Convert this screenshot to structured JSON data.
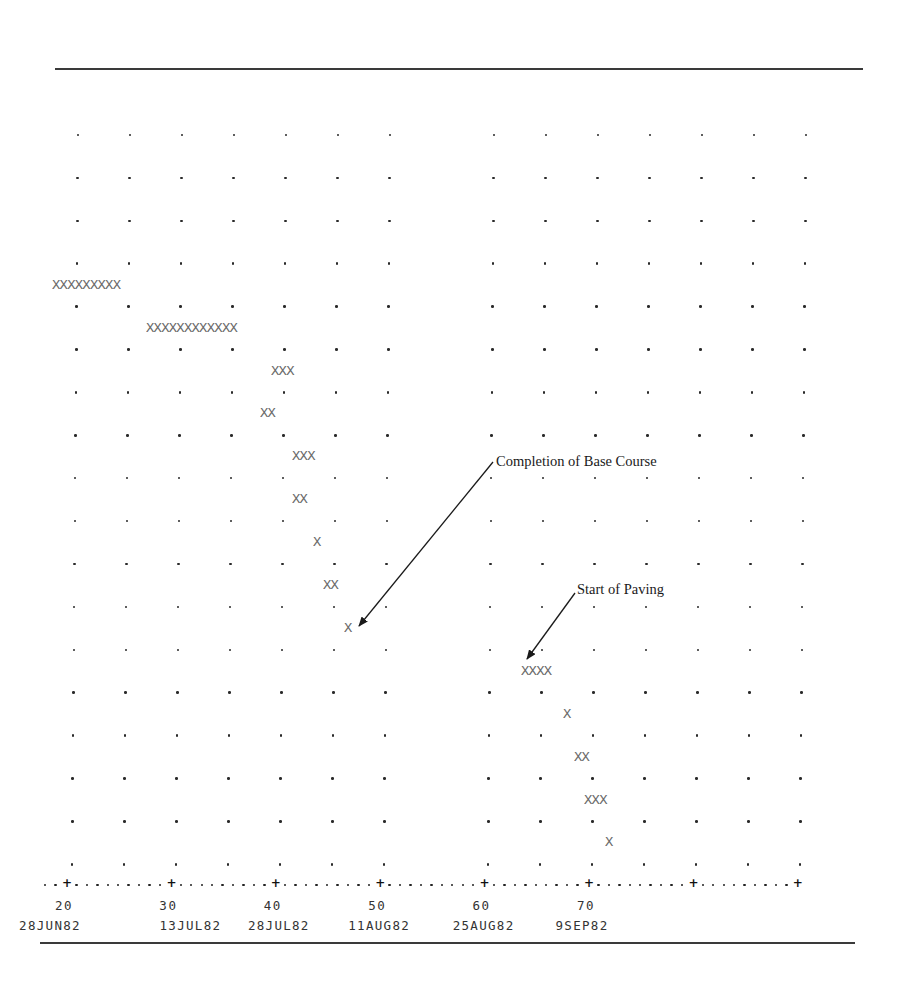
{
  "chart_data": {
    "type": "scatter",
    "title": "",
    "xlabel": "",
    "ylabel": "",
    "xlim": [
      18,
      90
    ],
    "x_ticks": [
      20,
      30,
      40,
      50,
      60,
      70,
      80,
      90
    ],
    "x_tick_labels": [
      "20",
      "30",
      "40",
      "50",
      "60",
      "70",
      "",
      ""
    ],
    "x_date_labels": [
      "28JUN82",
      "13JUL82",
      "28JUL82",
      "11AUG82",
      "25AUG82",
      "9SEP82"
    ],
    "grid": "dot-matrix",
    "series": [
      {
        "row": 1,
        "start_day": 19,
        "length": 9,
        "marks": "XXXXXXXXX"
      },
      {
        "row": 2,
        "start_day": 28,
        "length": 12,
        "marks": "XXXXXXXXXXXX"
      },
      {
        "row": 3,
        "start_day": 40,
        "length": 3,
        "marks": "XXX"
      },
      {
        "row": 4,
        "start_day": 39,
        "length": 2,
        "marks": "XX"
      },
      {
        "row": 5,
        "start_day": 42,
        "length": 3,
        "marks": "XXX"
      },
      {
        "row": 6,
        "start_day": 42,
        "length": 2,
        "marks": "XX"
      },
      {
        "row": 7,
        "start_day": 44,
        "length": 1,
        "marks": "X"
      },
      {
        "row": 8,
        "start_day": 45,
        "length": 2,
        "marks": "XX"
      },
      {
        "row": 9,
        "start_day": 47,
        "length": 1,
        "marks": "X"
      },
      {
        "row": 10,
        "start_day": 64,
        "length": 4,
        "marks": "XXXX"
      },
      {
        "row": 11,
        "start_day": 68,
        "length": 1,
        "marks": "X"
      },
      {
        "row": 12,
        "start_day": 69,
        "length": 2,
        "marks": "XX"
      },
      {
        "row": 13,
        "start_day": 70,
        "length": 3,
        "marks": "XXX"
      },
      {
        "row": 14,
        "start_day": 72,
        "length": 1,
        "marks": "X"
      }
    ],
    "annotations": [
      {
        "text": "Completion of Base Course",
        "points_to": {
          "row": 9,
          "day": 47
        }
      },
      {
        "text": "Start of Paving",
        "points_to": {
          "row": 10,
          "day": 64
        }
      }
    ]
  },
  "annotations": {
    "base_course": "Completion of Base Course",
    "paving": "Start of Paving"
  },
  "axis": {
    "ticks": [
      {
        "num": "20",
        "date": "28JUN82"
      },
      {
        "num": "30",
        "date": "13JUL82"
      },
      {
        "num": "40",
        "date": "28JUL82"
      },
      {
        "num": "50",
        "date": "11AUG82"
      },
      {
        "num": "60",
        "date": "25AUG82"
      },
      {
        "num": "70",
        "date": "9SEP82"
      }
    ]
  },
  "colors": {
    "ink": "#222222",
    "marks": "#6a6a6a",
    "background": "#ffffff"
  }
}
